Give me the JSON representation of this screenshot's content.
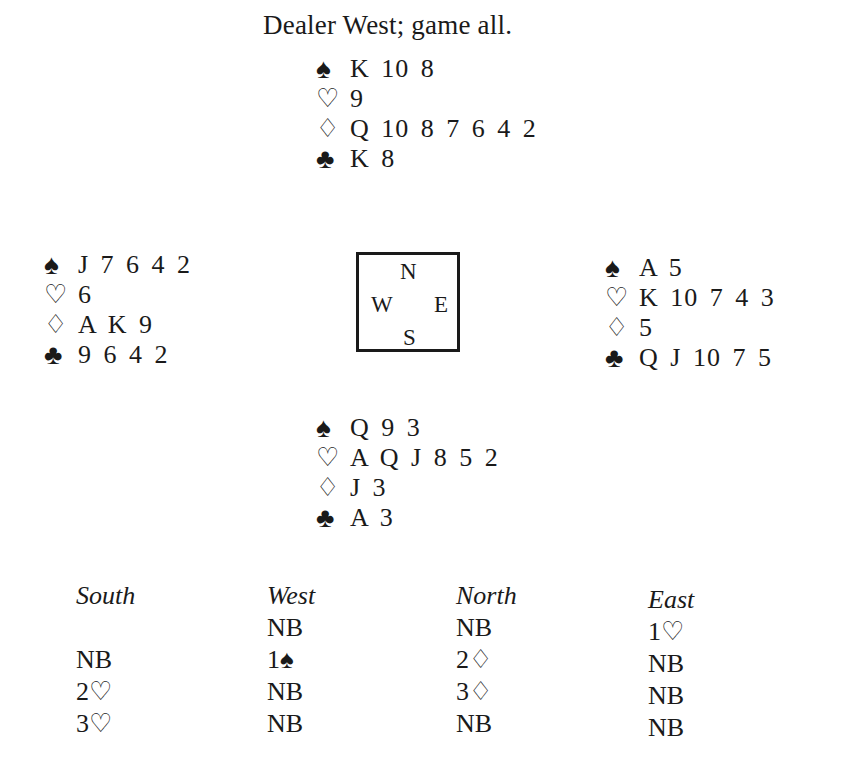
{
  "caption": "Dealer West; game all.",
  "suit_icons": {
    "spades": "♠",
    "hearts": "♡",
    "diamonds": "♢",
    "clubs": "♣"
  },
  "hands": {
    "north": {
      "spades": "K 10 8",
      "hearts": "9",
      "diamonds": "Q 10 8 7 6 4 2",
      "clubs": "K 8"
    },
    "west": {
      "spades": "J 7 6 4 2",
      "hearts": "6",
      "diamonds": "A K 9",
      "clubs": "9 6 4 2"
    },
    "east": {
      "spades": "A 5",
      "hearts": "K 10 7 4 3",
      "diamonds": "5",
      "clubs": "Q J 10 7 5"
    },
    "south": {
      "spades": "Q 9 3",
      "hearts": "A Q J 8 5 2",
      "diamonds": "J 3",
      "clubs": "A 3"
    }
  },
  "compass": {
    "n": "N",
    "w": "W",
    "e": "E",
    "s": "S"
  },
  "auction": {
    "headers": [
      "South",
      "West",
      "North",
      "East"
    ],
    "columns": {
      "south": [
        "",
        "NB",
        "2♡",
        "3♡"
      ],
      "west": [
        "NB",
        "1♠",
        "NB",
        "NB"
      ],
      "north": [
        "NB",
        "2♢",
        "3♢",
        "NB"
      ],
      "east": [
        "1♡",
        "NB",
        "NB",
        "NB"
      ]
    }
  }
}
